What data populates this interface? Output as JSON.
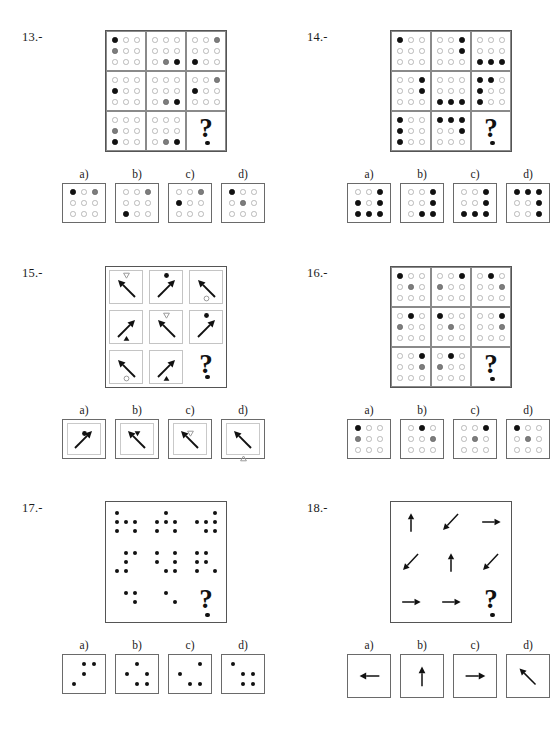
{
  "page": {
    "option_letters": [
      "a)",
      "b)",
      "c)",
      "d)"
    ],
    "question_glyph": "?"
  },
  "legend": {
    "dot_states": {
      "o": "empty-circle",
      "g": "gray-filled-circle",
      "k": "black-filled-circle",
      "n": "none"
    },
    "colors": {
      "empty_outline": "#b9b9b9",
      "gray_fill": "#7d7d7d",
      "black_fill": "#111111",
      "frame": "#555555",
      "inner_frame": "#8a8a8a"
    }
  },
  "puzzles": [
    {
      "id": "13",
      "label": "13.-",
      "type": "dot-matrix",
      "matrix": [
        [
          [
            "k",
            "o",
            "o",
            "g",
            "o",
            "o",
            "o",
            "o",
            "o"
          ],
          [
            "o",
            "o",
            "o",
            "o",
            "o",
            "o",
            "o",
            "g",
            "k"
          ],
          [
            "o",
            "o",
            "g",
            "o",
            "o",
            "o",
            "k",
            "o",
            "o"
          ]
        ],
        [
          [
            "o",
            "o",
            "o",
            "k",
            "o",
            "o",
            "o",
            "o",
            "o"
          ],
          [
            "o",
            "o",
            "o",
            "o",
            "o",
            "o",
            "o",
            "g",
            "k"
          ],
          [
            "o",
            "o",
            "g",
            "k",
            "o",
            "o",
            "o",
            "o",
            "o"
          ]
        ],
        [
          [
            "o",
            "o",
            "o",
            "g",
            "o",
            "o",
            "k",
            "o",
            "o"
          ],
          [
            "o",
            "o",
            "o",
            "o",
            "o",
            "o",
            "o",
            "g",
            "k"
          ],
          [
            "QUESTION"
          ]
        ]
      ],
      "options": [
        [
          "k",
          "o",
          "g",
          "o",
          "o",
          "o",
          "o",
          "o",
          "o"
        ],
        [
          "o",
          "o",
          "g",
          "o",
          "o",
          "o",
          "k",
          "o",
          "o"
        ],
        [
          "o",
          "o",
          "g",
          "k",
          "o",
          "o",
          "o",
          "o",
          "o"
        ],
        [
          "k",
          "o",
          "o",
          "o",
          "g",
          "o",
          "o",
          "o",
          "o"
        ]
      ]
    },
    {
      "id": "14",
      "label": "14.-",
      "type": "dot-matrix",
      "matrix": [
        [
          [
            "k",
            "o",
            "o",
            "o",
            "o",
            "o",
            "o",
            "o",
            "o"
          ],
          [
            "o",
            "o",
            "k",
            "o",
            "o",
            "k",
            "o",
            "o",
            "o"
          ],
          [
            "o",
            "o",
            "o",
            "o",
            "o",
            "o",
            "k",
            "k",
            "k"
          ]
        ],
        [
          [
            "o",
            "o",
            "k",
            "o",
            "o",
            "k",
            "o",
            "o",
            "o"
          ],
          [
            "o",
            "o",
            "o",
            "o",
            "o",
            "o",
            "k",
            "k",
            "k"
          ],
          [
            "k",
            "k",
            "o",
            "k",
            "o",
            "o",
            "k",
            "o",
            "o"
          ]
        ],
        [
          [
            "k",
            "o",
            "o",
            "k",
            "o",
            "o",
            "k",
            "o",
            "o"
          ],
          [
            "k",
            "k",
            "k",
            "o",
            "o",
            "k",
            "o",
            "o",
            "o"
          ],
          [
            "QUESTION"
          ]
        ]
      ],
      "options": [
        [
          "o",
          "o",
          "k",
          "k",
          "o",
          "k",
          "k",
          "k",
          "k"
        ],
        [
          "o",
          "o",
          "k",
          "o",
          "o",
          "k",
          "o",
          "k",
          "k"
        ],
        [
          "o",
          "o",
          "k",
          "o",
          "o",
          "k",
          "k",
          "k",
          "k"
        ],
        [
          "k",
          "k",
          "k",
          "o",
          "o",
          "k",
          "o",
          "o",
          "k"
        ]
      ]
    },
    {
      "id": "15",
      "label": "15.-",
      "type": "arrow-matrix",
      "cells": [
        {
          "arrow": "up-left",
          "marker": "triangle-down-outline",
          "marker_pos": "top"
        },
        {
          "arrow": "up-right",
          "marker": "circle-filled",
          "marker_pos": "top"
        },
        {
          "arrow": "up-left",
          "marker": "circle-outline",
          "marker_pos": "bottom"
        },
        {
          "arrow": "up-right",
          "marker": "triangle-up-filled",
          "marker_pos": "bottom"
        },
        {
          "arrow": "up-left",
          "marker": "triangle-down-outline",
          "marker_pos": "top"
        },
        {
          "arrow": "up-right",
          "marker": "circle-filled",
          "marker_pos": "top"
        },
        {
          "arrow": "up-left",
          "marker": "circle-outline",
          "marker_pos": "bottom"
        },
        {
          "arrow": "up-right",
          "marker": "triangle-up-filled",
          "marker_pos": "bottom"
        },
        {
          "arrow": "QUESTION",
          "marker": "none",
          "marker_pos": "none"
        }
      ],
      "options": [
        {
          "arrow": "up-right",
          "marker": "circle-filled",
          "marker_pos": "top"
        },
        {
          "arrow": "up-left",
          "marker": "triangle-down-filled",
          "marker_pos": "top"
        },
        {
          "arrow": "up-left",
          "marker": "triangle-down-outline",
          "marker_pos": "top"
        },
        {
          "arrow": "up-left",
          "marker": "triangle-up-outline",
          "marker_pos": "bottom"
        }
      ]
    },
    {
      "id": "16",
      "label": "16.-",
      "type": "dot-matrix",
      "matrix": [
        [
          [
            "k",
            "o",
            "o",
            "o",
            "g",
            "o",
            "o",
            "o",
            "o"
          ],
          [
            "o",
            "o",
            "k",
            "g",
            "o",
            "o",
            "o",
            "o",
            "o"
          ],
          [
            "o",
            "k",
            "o",
            "o",
            "o",
            "g",
            "o",
            "o",
            "o"
          ]
        ],
        [
          [
            "o",
            "k",
            "o",
            "g",
            "o",
            "o",
            "o",
            "o",
            "o"
          ],
          [
            "k",
            "o",
            "o",
            "o",
            "g",
            "o",
            "o",
            "o",
            "o"
          ],
          [
            "o",
            "o",
            "k",
            "o",
            "o",
            "g",
            "o",
            "o",
            "o"
          ]
        ],
        [
          [
            "o",
            "o",
            "k",
            "o",
            "o",
            "g",
            "o",
            "o",
            "o"
          ],
          [
            "o",
            "k",
            "o",
            "g",
            "o",
            "o",
            "o",
            "o",
            "o"
          ],
          [
            "QUESTION"
          ]
        ]
      ],
      "options": [
        [
          "k",
          "o",
          "o",
          "g",
          "o",
          "o",
          "o",
          "o",
          "o"
        ],
        [
          "o",
          "k",
          "o",
          "o",
          "o",
          "g",
          "o",
          "o",
          "o"
        ],
        [
          "o",
          "o",
          "k",
          "o",
          "g",
          "o",
          "o",
          "o",
          "o"
        ],
        [
          "k",
          "o",
          "o",
          "o",
          "g",
          "o",
          "o",
          "o",
          "o"
        ]
      ]
    },
    {
      "id": "17",
      "label": "17.-",
      "type": "plain-dot-matrix",
      "matrix": [
        [
          [
            "k",
            "n",
            "n",
            "k",
            "k",
            "k",
            "k",
            "n",
            "k"
          ],
          [
            "n",
            "k",
            "n",
            "k",
            "k",
            "k",
            "k",
            "n",
            "k"
          ],
          [
            "n",
            "n",
            "k",
            "k",
            "k",
            "k",
            "n",
            "k",
            "k"
          ]
        ],
        [
          [
            "n",
            "k",
            "k",
            "n",
            "k",
            "n",
            "k",
            "k",
            "n"
          ],
          [
            "k",
            "n",
            "k",
            "k",
            "n",
            "k",
            "n",
            "k",
            "k"
          ],
          [
            "k",
            "k",
            "n",
            "k",
            "k",
            "n",
            "k",
            "n",
            "k"
          ]
        ],
        [
          [
            "n",
            "k",
            "k",
            "n",
            "n",
            "k",
            "n",
            "n",
            "n"
          ],
          [
            "n",
            "k",
            "n",
            "n",
            "n",
            "k",
            "n",
            "n",
            "n"
          ],
          [
            "QUESTION"
          ]
        ]
      ],
      "options": [
        [
          "n",
          "k",
          "k",
          "n",
          "k",
          "n",
          "k",
          "n",
          "n"
        ],
        [
          "n",
          "k",
          "n",
          "k",
          "n",
          "k",
          "n",
          "k",
          "k"
        ],
        [
          "n",
          "n",
          "k",
          "k",
          "n",
          "n",
          "n",
          "k",
          "k"
        ],
        [
          "k",
          "n",
          "n",
          "n",
          "k",
          "k",
          "n",
          "k",
          "k"
        ]
      ]
    },
    {
      "id": "18",
      "label": "18.-",
      "type": "big-arrow-matrix",
      "cells": [
        "up",
        "down-left",
        "right",
        "down-left",
        "up",
        "down-left",
        "right",
        "right",
        "QUESTION"
      ],
      "options": [
        "left",
        "up",
        "right",
        "up-left"
      ]
    }
  ]
}
